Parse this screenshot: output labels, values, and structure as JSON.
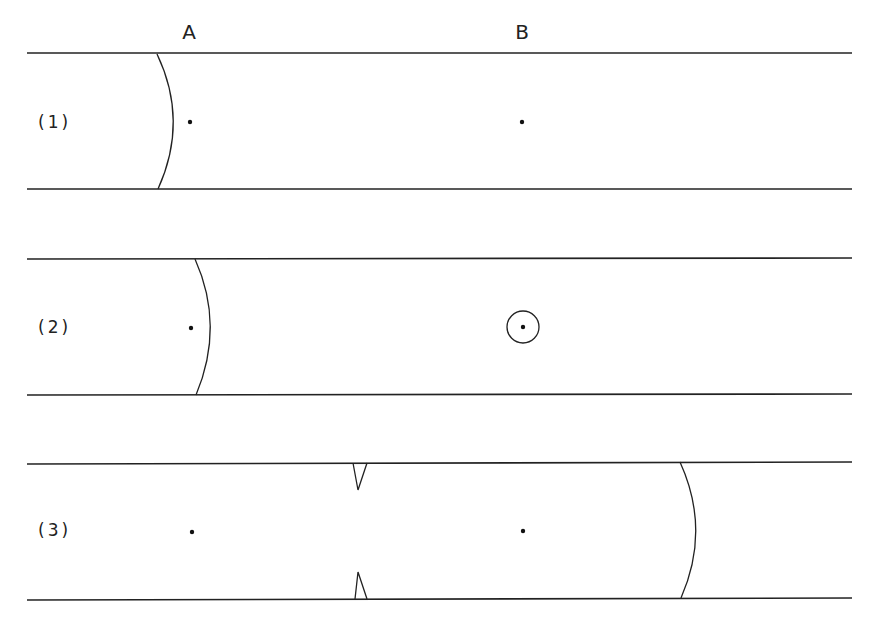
{
  "columns": [
    {
      "label": "A",
      "x": 189
    },
    {
      "label": "B",
      "x": 522
    }
  ],
  "rows": [
    {
      "label": "(1)",
      "top": 53,
      "bottom": 189,
      "center": 122
    },
    {
      "label": "(2)",
      "top": 258,
      "bottom": 395,
      "center": 327
    },
    {
      "label": "(3)",
      "top": 463,
      "bottom": 599,
      "center": 530
    }
  ],
  "colors": {
    "line": "#222222",
    "background": "#ffffff"
  }
}
